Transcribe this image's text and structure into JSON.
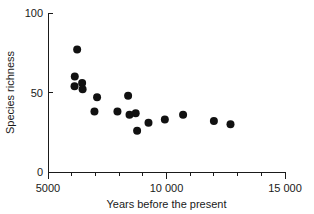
{
  "chart_data": {
    "type": "scatter",
    "title": "",
    "xlabel": "Years before the present",
    "ylabel": "Species richness",
    "xlim": [
      5000,
      15000
    ],
    "ylim": [
      0,
      100
    ],
    "grid": false,
    "legend": null,
    "x_major_ticks": [
      5000,
      10000,
      15000
    ],
    "x_major_tick_labels": [
      "5000",
      "10 000",
      "15 000"
    ],
    "x_minor_ticks": [
      6000,
      7000,
      8000,
      9000,
      11000,
      12000,
      13000,
      14000
    ],
    "y_major_ticks": [
      0,
      50,
      100
    ],
    "y_major_tick_labels": [
      "0",
      "50",
      "100"
    ],
    "marker": "filled-circle",
    "marker_color": "#111111",
    "marker_size_px": 4.0,
    "points": [
      {
        "x": 6230,
        "y": 77
      },
      {
        "x": 6130,
        "y": 60
      },
      {
        "x": 6120,
        "y": 54
      },
      {
        "x": 6440,
        "y": 56
      },
      {
        "x": 6460,
        "y": 52
      },
      {
        "x": 7070,
        "y": 47
      },
      {
        "x": 6960,
        "y": 38
      },
      {
        "x": 7930,
        "y": 38
      },
      {
        "x": 8380,
        "y": 48
      },
      {
        "x": 8440,
        "y": 36
      },
      {
        "x": 8700,
        "y": 37
      },
      {
        "x": 8760,
        "y": 26
      },
      {
        "x": 9240,
        "y": 31
      },
      {
        "x": 9930,
        "y": 33
      },
      {
        "x": 10700,
        "y": 36
      },
      {
        "x": 12000,
        "y": 32
      },
      {
        "x": 12700,
        "y": 30
      }
    ]
  },
  "axis": {
    "x_title": "Years before the present",
    "y_title": "Species richness"
  }
}
